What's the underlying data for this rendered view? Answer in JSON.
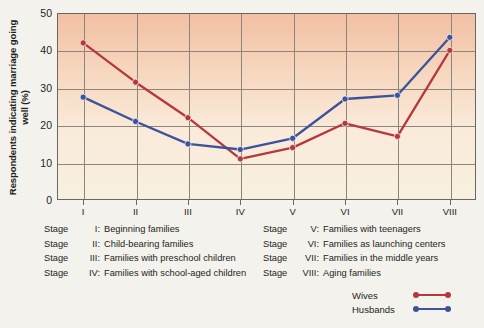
{
  "chart_data": {
    "type": "line",
    "title": "",
    "xlabel": "",
    "ylabel": "Respondents indicating marriage going well (%)",
    "categories": [
      "I",
      "II",
      "III",
      "IV",
      "V",
      "VI",
      "VII",
      "VIII"
    ],
    "ylim": [
      0,
      50
    ],
    "yticks": [
      0,
      10,
      20,
      30,
      40,
      50
    ],
    "grid": true,
    "legend_position": "bottom-right",
    "series": [
      {
        "name": "Wives",
        "color": "#b5393c",
        "values": [
          42,
          31.5,
          22,
          11,
          14,
          20.5,
          17,
          40
        ]
      },
      {
        "name": "Husbands",
        "color": "#3c529b",
        "values": [
          27.5,
          21,
          15,
          13.5,
          16.5,
          27,
          28,
          43.5
        ]
      }
    ]
  },
  "captions": {
    "left": [
      {
        "word": "Stage",
        "num": "I:",
        "text": "Beginning families"
      },
      {
        "word": "Stage",
        "num": "II:",
        "text": "Child-bearing families"
      },
      {
        "word": "Stage",
        "num": "III:",
        "text": "Families with preschool children"
      },
      {
        "word": "Stage",
        "num": "IV:",
        "text": "Families with school-aged children"
      }
    ],
    "right": [
      {
        "word": "Stage",
        "num": "V:",
        "text": "Families with teenagers"
      },
      {
        "word": "Stage",
        "num": "VI:",
        "text": "Families as launching centers"
      },
      {
        "word": "Stage",
        "num": "VII:",
        "text": "Families in the middle years"
      },
      {
        "word": "Stage",
        "num": "VIII:",
        "text": "Aging families"
      }
    ]
  },
  "legend": [
    {
      "label": "Wives",
      "color": "#b5393c"
    },
    {
      "label": "Husbands",
      "color": "#3c529b"
    }
  ]
}
